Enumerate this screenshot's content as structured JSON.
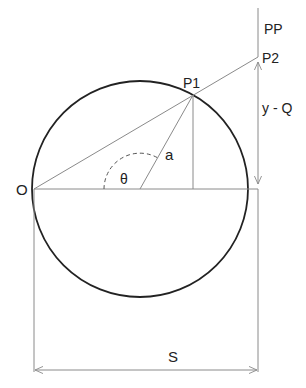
{
  "diagram": {
    "type": "geometry-construction",
    "colors": {
      "circle": "#222222",
      "lines": "#8a8a8a",
      "arc": "#555555",
      "text": "#222222",
      "background": "#ffffff"
    },
    "labels": {
      "origin": "O",
      "point1": "P1",
      "point2": "P2",
      "line_pp": "PP",
      "radius": "a",
      "angle": "θ",
      "vertical_dimension": "y - Q",
      "horizontal_dimension": "S"
    },
    "geometry": {
      "circle_center": [
        140,
        189
      ],
      "circle_radius": 108,
      "O": [
        34,
        189
      ],
      "P1": [
        193,
        95
      ],
      "P2": [
        258,
        57
      ],
      "PP_line_x": 258,
      "PP_line_top_y": 8,
      "S_dimension_y": 370
    }
  }
}
